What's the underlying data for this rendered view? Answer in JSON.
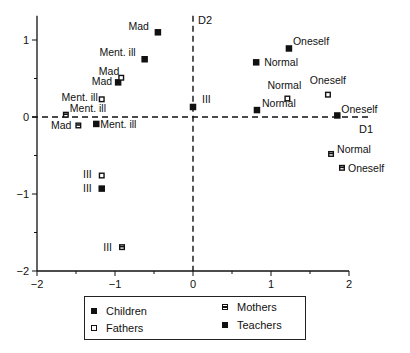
{
  "chart_data": {
    "type": "scatter",
    "title": "",
    "xlabel": "D1",
    "ylabel": "D2",
    "xlim": [
      -2,
      2
    ],
    "ylim": [
      -2,
      1.25
    ],
    "x_ticks": [
      -2,
      -1,
      0,
      1,
      2
    ],
    "y_ticks": [
      -2,
      -1,
      0,
      1
    ],
    "grid": false,
    "legend_position": "bottom",
    "series": [
      {
        "name": "Children",
        "marker": "filled-square",
        "points": [
          {
            "label": "Mad",
            "x": -0.45,
            "y": 1.1
          },
          {
            "label": "Ment. ill",
            "x": -0.62,
            "y": 0.75
          },
          {
            "label": "Mad",
            "x": -0.96,
            "y": 0.45
          },
          {
            "label": "Ment. ill",
            "x": -1.24,
            "y": -0.09
          },
          {
            "label": "Ill",
            "x": 0.0,
            "y": 0.13
          },
          {
            "label": "Oneself",
            "x": 1.23,
            "y": 0.89
          },
          {
            "label": "Normal",
            "x": 0.81,
            "y": 0.71
          },
          {
            "label": "Normal",
            "x": 0.82,
            "y": 0.09
          },
          {
            "label": "Oneself",
            "x": 1.85,
            "y": 0.02
          },
          {
            "label": "Ill",
            "x": -1.17,
            "y": -0.93
          }
        ]
      },
      {
        "name": "Fathers",
        "marker": "open-square",
        "points": [
          {
            "label": "Mad",
            "x": -0.92,
            "y": 0.51
          },
          {
            "label": "Ment. ill",
            "x": -1.17,
            "y": 0.23
          },
          {
            "label": "Normal",
            "x": 1.21,
            "y": 0.24
          },
          {
            "label": "Oneself",
            "x": 1.73,
            "y": 0.29
          },
          {
            "label": "Ill",
            "x": -1.17,
            "y": -0.76
          }
        ]
      },
      {
        "name": "Mothers",
        "marker": "barred-square",
        "points": [
          {
            "label": "Ment. ill",
            "x": -1.63,
            "y": 0.03
          },
          {
            "label": "Mad",
            "x": -1.47,
            "y": -0.11
          },
          {
            "label": "Normal",
            "x": 1.77,
            "y": -0.48
          },
          {
            "label": "Oneself",
            "x": 1.91,
            "y": -0.66
          },
          {
            "label": "Ill",
            "x": -0.91,
            "y": -1.69
          }
        ]
      },
      {
        "name": "Teachers",
        "marker": "filled-square",
        "points": []
      }
    ],
    "legend": [
      "Children",
      "Mothers",
      "Fathers",
      "Teachers"
    ]
  },
  "legend": {
    "children": "Children",
    "mothers": "Mothers",
    "fathers": "Fathers",
    "teachers": "Teachers"
  },
  "axes": {
    "x_tick_labels": [
      "−2",
      "−1",
      "0",
      "1",
      "2"
    ],
    "y_tick_labels": [
      "1",
      "0",
      "−1",
      "−2"
    ],
    "d1_label": "D1",
    "d2_label": "D2"
  }
}
